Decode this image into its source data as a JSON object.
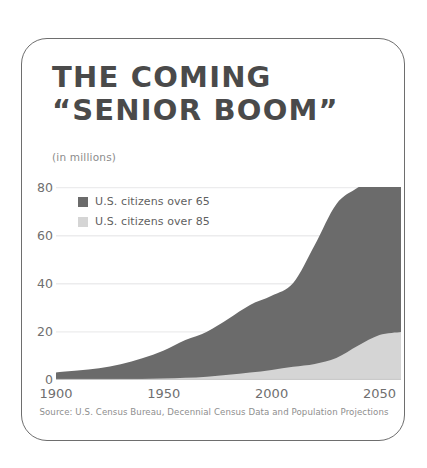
{
  "card": {
    "title_line_1": "THE COMING",
    "title_line_2": "“SENIOR BOOM”",
    "units_note": "(in millions)",
    "source": "Source: U.S. Census Bureau, Decennial Census Data and Population Projections"
  },
  "legend": {
    "items": [
      {
        "label": "U.S. citizens over 65",
        "color": "#6b6b6b",
        "swatch_name": "legend-swatch-over-65"
      },
      {
        "label": "U.S. citizens over 85",
        "color": "#d5d5d5",
        "swatch_name": "legend-swatch-over-85"
      }
    ]
  },
  "colors": {
    "over_65": "#6b6b6b",
    "over_85": "#d5d5d5",
    "gridline": "#ececed",
    "axis_text": "#6f6f6f",
    "title_text": "#4a4a4a",
    "border": "#6e6e6e"
  },
  "chart_data": {
    "type": "area",
    "stacked": true,
    "title": "THE COMING “SENIOR BOOM”",
    "subtitle": "(in millions)",
    "xlabel": "",
    "ylabel": "(in millions)",
    "xlim": [
      1900,
      2060
    ],
    "ylim": [
      0,
      80
    ],
    "yticks": [
      0,
      20,
      40,
      60,
      80
    ],
    "xticks": [
      1900,
      1950,
      2000,
      2050
    ],
    "grid": "horizontal",
    "legend_position": "inside-top-left",
    "x": [
      1900,
      1910,
      1920,
      1930,
      1940,
      1950,
      1960,
      1970,
      1980,
      1990,
      2000,
      2010,
      2020,
      2030,
      2040,
      2050,
      2060
    ],
    "series": [
      {
        "name": "U.S. citizens over 85",
        "color": "#d5d5d5",
        "values": [
          0.1,
          0.2,
          0.2,
          0.3,
          0.4,
          0.6,
          0.9,
          1.4,
          2.2,
          3.1,
          4.2,
          5.5,
          6.7,
          9.1,
          14.2,
          18.7,
          20.0
        ]
      },
      {
        "name": "U.S. citizens over 65",
        "color": "#6b6b6b",
        "values": [
          3.1,
          3.9,
          4.9,
          6.6,
          9.0,
          12.3,
          16.6,
          20.1,
          25.5,
          31.2,
          35.0,
          40.3,
          56.1,
          73.1,
          80.0,
          85.7,
          94.7
        ]
      }
    ],
    "series_note": "U.S. citizens over 65 is the total of both bands; the over-85 band is nested inside it",
    "total_top_values": [
      3.1,
      3.9,
      4.9,
      6.6,
      9.0,
      12.3,
      16.6,
      20.1,
      25.5,
      31.2,
      35.0,
      40.3,
      56.1,
      73.1,
      80.0,
      85.7,
      94.7
    ],
    "annotations": []
  }
}
